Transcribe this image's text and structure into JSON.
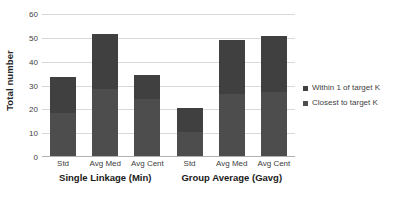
{
  "chart_data": {
    "type": "bar",
    "subtype": "stacked-bar-grouped",
    "title": "",
    "xlabel": "",
    "ylabel": "Total number",
    "ylim": [
      0,
      60
    ],
    "yticks": [
      0,
      10,
      20,
      30,
      40,
      50,
      60
    ],
    "grid": true,
    "legend_position": "right",
    "categories": [
      "Std",
      "Avg Med",
      "Avg Cent",
      "Std",
      "Avg Med",
      "Avg Cent"
    ],
    "groups": [
      {
        "label": "Single Linkage (Min)",
        "categories": [
          "Std",
          "Avg Med",
          "Avg Cent"
        ]
      },
      {
        "label": "Group Average (Gavg)",
        "categories": [
          "Std",
          "Avg Med",
          "Avg Cent"
        ]
      }
    ],
    "series": [
      {
        "name": "Closest to target K",
        "color": "#4d4d4d",
        "values": [
          18,
          28,
          24,
          10,
          26,
          27
        ]
      },
      {
        "name": "Within 1 of target K",
        "color": "#404040",
        "values": [
          15,
          23,
          10,
          10,
          22.5,
          23.5
        ]
      }
    ],
    "totals": [
      33,
      51,
      34,
      20,
      48.5,
      50.5
    ]
  },
  "axes": {
    "y_title": "Total number",
    "y_tick_labels": [
      "0",
      "10",
      "20",
      "30",
      "40",
      "50",
      "60"
    ]
  },
  "legend": {
    "items": [
      {
        "label": "Within 1 of target K",
        "color": "#404040"
      },
      {
        "label": "Closest to target K",
        "color": "#4d4d4d"
      }
    ]
  },
  "colors": {
    "grid": "#d9d9d9",
    "axis": "#b0b0b0",
    "background": "#ffffff",
    "text": "#3f3f3f"
  }
}
